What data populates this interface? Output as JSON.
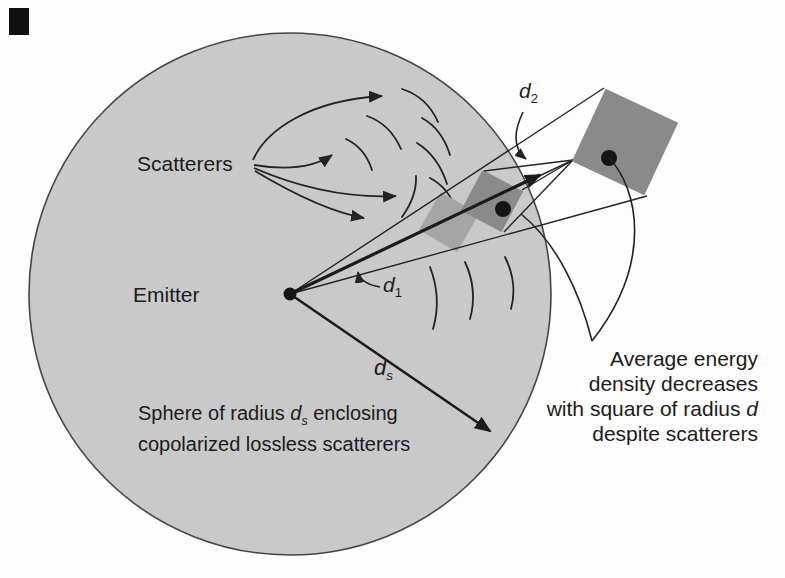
{
  "figure": {
    "title_semantic": "emitter-scatterer-sphere-diagram",
    "labels": {
      "scatterers": "Scatterers",
      "emitter": "Emitter",
      "d1": {
        "base": "d",
        "sub": "1"
      },
      "d2": {
        "base": "d",
        "sub": "2"
      },
      "ds": {
        "base": "d",
        "sub": "s"
      },
      "sphere_note": {
        "pre": "Sphere of radius ",
        "base": "d",
        "sub": "s",
        "post": " enclosing",
        "line2": "copolarized lossless scatterers"
      },
      "right_note": {
        "line1": "Average energy",
        "line2": "density decreases",
        "line3_pre": "with square of radius ",
        "line3_var": "d",
        "line4": "despite scatterers"
      }
    },
    "colors": {
      "background": "#fdfdfd",
      "sphere_fill": "#c9c9c9",
      "sphere_edge": "#454545",
      "square_dark": "#8a8a8a",
      "square_light": "#a5a5a5",
      "stroke": "#232323",
      "text": "#1b1b1b",
      "corner_mark": "#101010"
    }
  }
}
